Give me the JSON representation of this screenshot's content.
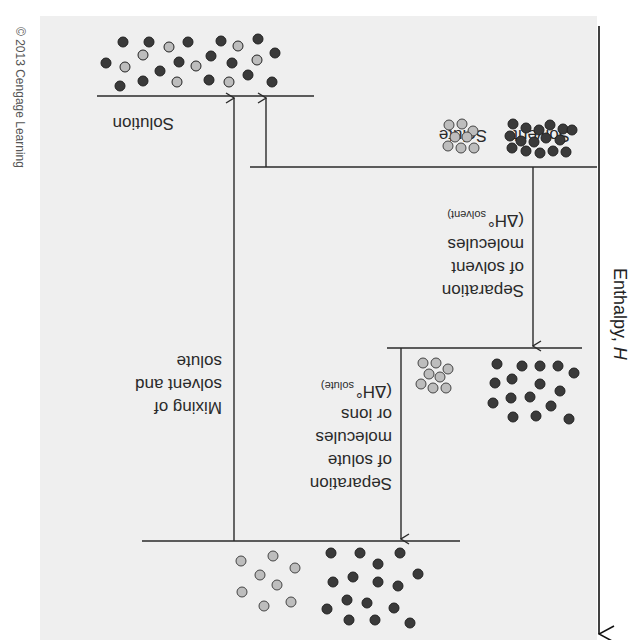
{
  "figure": {
    "orientation": "rotated-180",
    "copyright": "© 2013 Cengage Learning",
    "axis": {
      "label": "Enthalpy, ",
      "label_italic": "H"
    },
    "levels": {
      "solution": {
        "label": "Solution"
      },
      "separate": {
        "solvent_label": "Solvent",
        "solute_label": "Solute"
      }
    },
    "steps": {
      "solvent_separation": [
        "Separation",
        "of solvent",
        "molecules",
        "(ΔH°",
        "solvent)"
      ],
      "solute_separation": [
        "Separation",
        "of solute",
        "molecules",
        "or ions",
        "(ΔH°",
        "solute)"
      ],
      "mixing": [
        "Mixing of",
        "solvent and",
        "solute"
      ]
    },
    "colors": {
      "background": "#efefef",
      "solvent_particle": "#3a3a3a",
      "solute_particle": "#bdbdbd",
      "line": "#2a2a2a"
    }
  }
}
